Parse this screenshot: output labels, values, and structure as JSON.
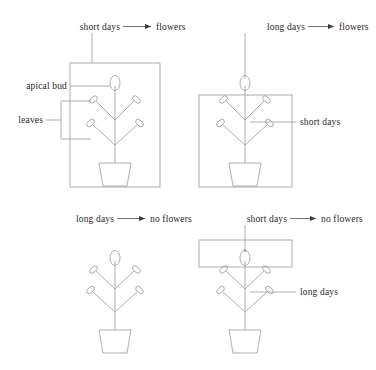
{
  "figure": {
    "title": "",
    "background": "#ffffff",
    "line_color": "#9a9a9a",
    "text_color": "#2a2723",
    "panels": [
      {
        "id": "panel-top-left",
        "treatment_label": "short days",
        "arrow": "➤",
        "result_label": "flowers",
        "enclosure": "whole-plant-box",
        "enclosure_shape": "rectangle",
        "callouts": [
          {
            "name": "apical-bud",
            "label": "apical bud",
            "side": "left"
          },
          {
            "name": "leaves",
            "label": "leaves",
            "side": "left"
          }
        ],
        "pointer_to": "enclosure-box-top"
      },
      {
        "id": "panel-top-right",
        "treatment_label": "long days",
        "arrow": "➤",
        "result_label": "flowers",
        "enclosure": "plant-body-box-excluding-bud",
        "enclosure_shape": "rectangle",
        "callouts": [
          {
            "name": "short-days",
            "label": "short days",
            "side": "right"
          }
        ],
        "pointer_to": "apical-bud"
      },
      {
        "id": "panel-bottom-left",
        "treatment_label": "long days",
        "arrow": "➤",
        "result_label": "no flowers",
        "enclosure": "none",
        "enclosure_shape": "none",
        "callouts": [],
        "pointer_to": "none"
      },
      {
        "id": "panel-bottom-right",
        "treatment_label": "short days",
        "arrow": "➤",
        "result_label": "no flowers",
        "enclosure": "apical-bud-box",
        "enclosure_shape": "wide-rectangle",
        "callouts": [
          {
            "name": "long-days",
            "label": "long days",
            "side": "right"
          }
        ],
        "pointer_to": "apical-bud"
      }
    ]
  }
}
